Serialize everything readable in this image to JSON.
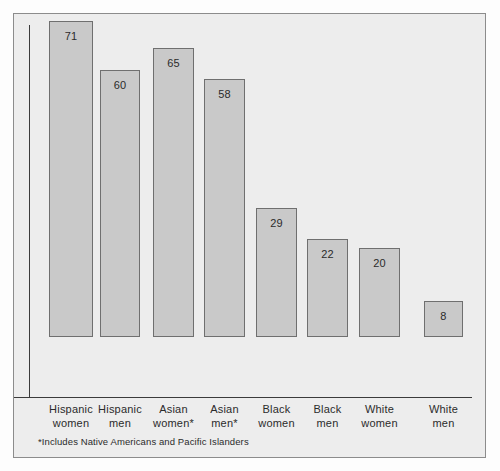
{
  "chart_data": {
    "type": "bar",
    "title": "",
    "subtitle": "",
    "xlabel": "",
    "ylabel": "",
    "ylim": [
      0,
      80
    ],
    "grid": false,
    "legend": null,
    "categories": [
      "Hispanic\nwomen",
      "Hispanic\nmen",
      "Asian\nwomen*",
      "Asian\nmen*",
      "Black\nwomen",
      "Black\nmen",
      "White\nwomen",
      "White\nmen"
    ],
    "category_lines": [
      [
        "Hispanic",
        "women"
      ],
      [
        "Hispanic",
        "men"
      ],
      [
        "Asian",
        "women*"
      ],
      [
        "Asian",
        "men*"
      ],
      [
        "Black",
        "women"
      ],
      [
        "Black",
        "men"
      ],
      [
        "White",
        "women"
      ],
      [
        "White",
        "men"
      ]
    ],
    "values": [
      71,
      60,
      65,
      58,
      29,
      22,
      20,
      8
    ],
    "value_labels": [
      "71",
      "60",
      "65",
      "58",
      "29",
      "22",
      "20",
      "8"
    ],
    "annotations": [
      "*Includes Native Americans and Pacific Islanders"
    ],
    "colors": {
      "bar_fill": "#c9c9c9",
      "bar_stroke": "#6f6f6f",
      "axis": "#3b3b3b",
      "panel_background": "#ededed",
      "panel_border": "#8c8c8c",
      "text": "#2b2b2b"
    }
  },
  "footnote": "*Includes Native Americans and Pacific Islanders"
}
